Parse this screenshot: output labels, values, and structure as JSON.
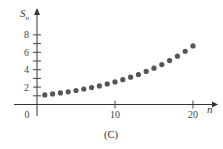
{
  "chart_data": {
    "type": "scatter",
    "title": "",
    "caption": "(C)",
    "xlabel": "n",
    "ylabel": "S",
    "ylabel_subscript": "n",
    "x_ticks_labeled": [
      0,
      10,
      20
    ],
    "y_ticks_labeled": [
      2,
      4,
      6,
      8
    ],
    "y_minor_step": 1,
    "xlim": [
      0,
      21
    ],
    "ylim": [
      0,
      9
    ],
    "grid": false,
    "legend": null,
    "series": [
      {
        "name": "S_n",
        "x": [
          1,
          2,
          3,
          4,
          5,
          6,
          7,
          8,
          9,
          10,
          11,
          12,
          13,
          14,
          15,
          16,
          17,
          18,
          19,
          20
        ],
        "values": [
          1.1,
          1.21,
          1.33,
          1.46,
          1.61,
          1.77,
          1.95,
          2.14,
          2.36,
          2.59,
          2.85,
          3.14,
          3.45,
          3.8,
          4.18,
          4.59,
          5.05,
          5.56,
          6.12,
          6.73
        ],
        "color": "#555555"
      }
    ],
    "axis_color": "#333333"
  }
}
